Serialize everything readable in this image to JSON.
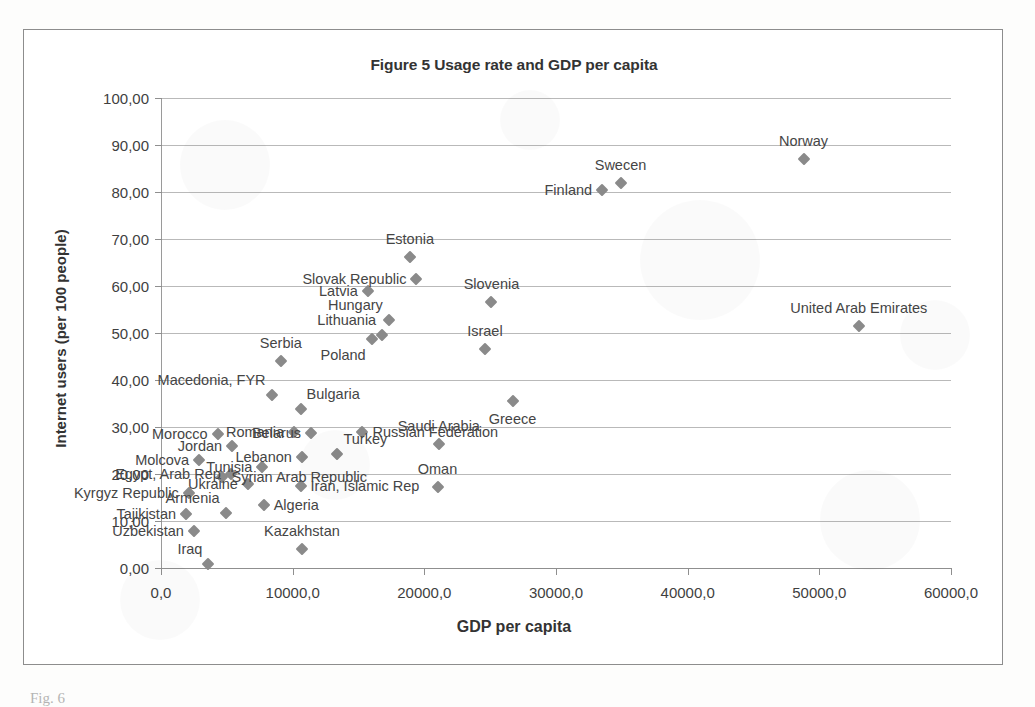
{
  "figure": {
    "title": "Figure 5 Usage rate and GDP per capita",
    "caption": "Fig. 6"
  },
  "axes": {
    "x_title": "GDP per capita",
    "y_title": "Internet users (per 100 people)",
    "x_ticks": [
      "0,0",
      "10000,0",
      "20000,0",
      "30000,0",
      "40000,0",
      "50000,0",
      "60000,0"
    ],
    "y_ticks": [
      "0,00",
      "10,00",
      "20,00",
      "30,00",
      "40,00",
      "50,00",
      "60,00",
      "70,00",
      "80,00",
      "90,00",
      "100,00"
    ]
  },
  "style": {
    "marker_color": "#8a8a8a",
    "gridline_color": "#b9b9b9",
    "axis_color": "#8f8f8f",
    "text_color": "#454545",
    "frame_color": "#8d8d8d"
  },
  "chart_data": {
    "type": "scatter",
    "title": "Figure 5 Usage rate and GDP per capita",
    "xlabel": "GDP per capita",
    "ylabel": "Internet users (per 100 people)",
    "xlim": [
      0,
      60000
    ],
    "ylim": [
      0,
      100
    ],
    "xtick_step": 10000,
    "ytick_step": 10,
    "grid": "horizontal",
    "legend": "none",
    "decimal_separator": ",",
    "series": [
      {
        "name": "Countries",
        "marker": "diamond",
        "color": "#8a8a8a",
        "points": [
          {
            "label": "Norway",
            "x": 48800,
            "y": 87.0,
            "label_pos": "above-mid"
          },
          {
            "label": "Swecen",
            "x": 34900,
            "y": 82.0,
            "label_pos": "above-mid"
          },
          {
            "label": "Finland",
            "x": 33500,
            "y": 80.5,
            "label_pos": "left"
          },
          {
            "label": "United Arab Emirates",
            "x": 53000,
            "y": 51.5,
            "label_pos": "above-mid"
          },
          {
            "label": "Estonia",
            "x": 18900,
            "y": 66.2,
            "label_pos": "above-mid"
          },
          {
            "label": "Slovak Republic",
            "x": 19400,
            "y": 61.5,
            "label_pos": "left"
          },
          {
            "label": "Slovenia",
            "x": 25100,
            "y": 56.5,
            "label_pos": "above-mid"
          },
          {
            "label": "Latvia",
            "x": 15700,
            "y": 59.0,
            "label_pos": "left"
          },
          {
            "label": "Hungary",
            "x": 17300,
            "y": 52.8,
            "label_pos": "above-left"
          },
          {
            "label": "Lithuania",
            "x": 16800,
            "y": 49.5,
            "label_pos": "above-left"
          },
          {
            "label": "Poland",
            "x": 16000,
            "y": 48.8,
            "label_pos": "below-left"
          },
          {
            "label": "Israel",
            "x": 24600,
            "y": 46.5,
            "label_pos": "above-mid"
          },
          {
            "label": "Serbia",
            "x": 9100,
            "y": 44.0,
            "label_pos": "above-mid"
          },
          {
            "label": "Greece",
            "x": 26700,
            "y": 35.5,
            "label_pos": "below-mid"
          },
          {
            "label": "Macedonia, FYR",
            "x": 8400,
            "y": 36.8,
            "label_pos": "above-left"
          },
          {
            "label": "Bulgaria",
            "x": 10600,
            "y": 33.8,
            "label_pos": "above-right"
          },
          {
            "label": "Turkey",
            "x": 13400,
            "y": 24.2,
            "label_pos": "above-right"
          },
          {
            "label": "Saudi Arabia",
            "x": 21100,
            "y": 26.3,
            "label_pos": "above-mid"
          },
          {
            "label": "Russian Federation",
            "x": 15300,
            "y": 29.0,
            "label_pos": "right"
          },
          {
            "label": "Belarus",
            "x": 11400,
            "y": 28.8,
            "label_pos": "left"
          },
          {
            "label": "Romania",
            "x": 10100,
            "y": 29.0,
            "label_pos": "left"
          },
          {
            "label": "Morocco",
            "x": 4300,
            "y": 28.6,
            "label_pos": "left"
          },
          {
            "label": "Jordan",
            "x": 5400,
            "y": 26.0,
            "label_pos": "left"
          },
          {
            "label": "Lebanon",
            "x": 10700,
            "y": 23.7,
            "label_pos": "left"
          },
          {
            "label": "Molcova",
            "x": 2900,
            "y": 23.0,
            "label_pos": "left"
          },
          {
            "label": "Tunisia",
            "x": 7700,
            "y": 21.4,
            "label_pos": "left"
          },
          {
            "label": "Oman",
            "x": 21000,
            "y": 17.2,
            "label_pos": "above-mid"
          },
          {
            "label": "Egypt, Arab Rep",
            "x": 5300,
            "y": 20.0,
            "label_pos": "left"
          },
          {
            "label": "Syrian Arab Republic",
            "x": 4600,
            "y": 19.3,
            "label_pos": "right"
          },
          {
            "label": "Ukraine",
            "x": 6600,
            "y": 17.9,
            "label_pos": "left"
          },
          {
            "label": "Iran, Islamic Rep",
            "x": 10600,
            "y": 17.5,
            "label_pos": "right"
          },
          {
            "label": "Kyrgyz Republic",
            "x": 2100,
            "y": 16.0,
            "label_pos": "left"
          },
          {
            "label": "Algeria",
            "x": 7800,
            "y": 13.5,
            "label_pos": "right"
          },
          {
            "label": "Tajikistan",
            "x": 1900,
            "y": 11.5,
            "label_pos": "left"
          },
          {
            "label": "Armenia",
            "x": 4900,
            "y": 11.8,
            "label_pos": "above-left"
          },
          {
            "label": "Uzbekistan",
            "x": 2500,
            "y": 7.8,
            "label_pos": "left"
          },
          {
            "label": "Kazakhstan",
            "x": 10700,
            "y": 4.0,
            "label_pos": "above-mid"
          },
          {
            "label": "Iraq",
            "x": 3600,
            "y": 0.9,
            "label_pos": "above-left"
          }
        ]
      }
    ]
  }
}
